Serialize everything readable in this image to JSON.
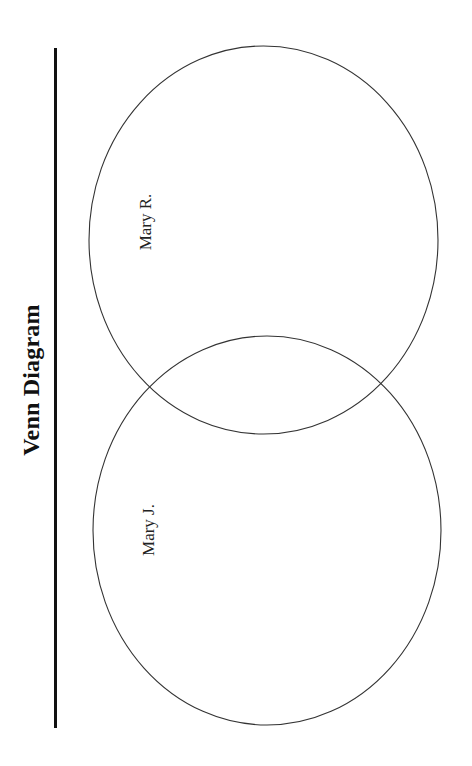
{
  "diagram": {
    "title": "Venn Diagram",
    "orientation": "rotated 90deg counter-clockwise",
    "sets": [
      {
        "id": "top",
        "label": "Mary R."
      },
      {
        "id": "bottom",
        "label": "Mary J."
      }
    ],
    "colors": {
      "outline": "#333333",
      "text": "#111111",
      "background": "#ffffff"
    }
  }
}
